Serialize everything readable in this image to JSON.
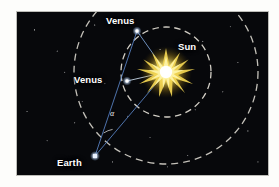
{
  "figure": {
    "background_color": "#07080b",
    "page_color": "#fdfdfb"
  },
  "labels": {
    "venus_outer": "Venus",
    "venus_inner": "Venus",
    "sun": "Sun",
    "earth": "Earth",
    "angle": "α"
  },
  "icons": {
    "sun": "sun-starburst-icon",
    "venus_outer": "venus-planet-dot-icon",
    "venus_inner": "venus-planet-dot-icon",
    "earth": "earth-planet-dot-icon"
  },
  "colors": {
    "sun_core": "#ffffff",
    "sun_glow": "#f5d84a",
    "sun_outer_glow": "#8a6b12",
    "sight_line": "#5b86c8",
    "orbit_dash": "#d8d5cc",
    "planet_dot": "#e8f0ff",
    "label_text": "#ffffff"
  },
  "bodies": [
    {
      "name": "sun",
      "label": "Sun",
      "x": 166,
      "y": 72,
      "role": "star"
    },
    {
      "name": "venus-outer",
      "label": "Venus",
      "x": 137,
      "y": 31,
      "role": "planet"
    },
    {
      "name": "venus-inner",
      "label": "Venus",
      "x": 127,
      "y": 81,
      "role": "planet"
    },
    {
      "name": "earth",
      "label": "Earth",
      "x": 95,
      "y": 156,
      "role": "planet"
    }
  ],
  "orbits": [
    {
      "name": "venus-orbit",
      "center_x": 166,
      "center_y": 72,
      "radius": 45,
      "style": "dashed",
      "complete": true
    },
    {
      "name": "earth-orbit",
      "center_x": 166,
      "center_y": 72,
      "radius": 92,
      "style": "dashed",
      "complete": false
    }
  ],
  "sight_lines": [
    {
      "name": "earth-to-venus-outer",
      "from": "earth",
      "to": "venus-outer"
    },
    {
      "name": "earth-to-sun",
      "from": "earth",
      "to": "sun"
    },
    {
      "name": "venus-outer-to-sun",
      "from": "venus-outer",
      "to": "sun"
    },
    {
      "name": "venus-inner-to-sun",
      "from": "venus-inner",
      "to": "sun"
    }
  ],
  "angle_marker": {
    "name": "elongation-angle",
    "symbol": "α",
    "vertex": "earth",
    "between": [
      "earth-to-venus-outer",
      "earth-to-sun"
    ]
  }
}
